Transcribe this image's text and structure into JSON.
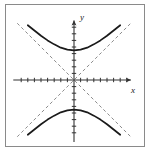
{
  "figure": {
    "background_color": "#ffffff",
    "frame_color": "#8a8a8a",
    "curve_color": "#1a1a1a",
    "axis_color": "#333333",
    "asymptote_color": "#8c8c8c"
  },
  "axes": {
    "x_label": "x",
    "y_label": "y",
    "x_ticks_left": 8,
    "x_ticks_right": 8,
    "y_ticks_up": 8,
    "y_ticks_down": 8,
    "tick_spacing_px": 6.6,
    "origin_x_px": 74,
    "origin_y_px": 80,
    "x_arrow": "arrow-right",
    "y_arrow": "arrow-up"
  },
  "chart_data": {
    "type": "line",
    "xlabel": "x",
    "ylabel": "y",
    "xlim": [
      -9,
      9
    ],
    "ylim": [
      -9,
      9
    ],
    "grid": false,
    "legend": "none",
    "equation": "y^2/9 - x^2/9 = 1",
    "vertices": [
      [
        0,
        4.5
      ],
      [
        0,
        -4.5
      ]
    ],
    "asymptote_slopes": [
      1,
      -1
    ],
    "series": [
      {
        "name": "upper-branch",
        "style": "solid",
        "points": [
          [
            -7.0,
            8.3
          ],
          [
            -6.0,
            7.5
          ],
          [
            -5.0,
            6.7
          ],
          [
            -4.0,
            6.0
          ],
          [
            -3.0,
            5.4
          ],
          [
            -2.0,
            4.9
          ],
          [
            -1.0,
            4.6
          ],
          [
            0.0,
            4.5
          ],
          [
            1.0,
            4.6
          ],
          [
            2.0,
            4.9
          ],
          [
            3.0,
            5.4
          ],
          [
            4.0,
            6.0
          ],
          [
            5.0,
            6.7
          ],
          [
            6.0,
            7.5
          ],
          [
            7.0,
            8.3
          ]
        ]
      },
      {
        "name": "lower-branch",
        "style": "solid",
        "points": [
          [
            -7.0,
            -8.3
          ],
          [
            -6.0,
            -7.5
          ],
          [
            -5.0,
            -6.7
          ],
          [
            -4.0,
            -6.0
          ],
          [
            -3.0,
            -5.4
          ],
          [
            -2.0,
            -4.9
          ],
          [
            -1.0,
            -4.6
          ],
          [
            0.0,
            -4.5
          ],
          [
            1.0,
            -4.6
          ],
          [
            2.0,
            -4.9
          ],
          [
            3.0,
            -5.4
          ],
          [
            4.0,
            -6.0
          ],
          [
            5.0,
            -6.7
          ],
          [
            6.0,
            -7.5
          ],
          [
            7.0,
            -8.3
          ]
        ]
      },
      {
        "name": "asymptote-positive",
        "style": "dashed",
        "points": [
          [
            -8.6,
            -8.6
          ],
          [
            8.6,
            8.6
          ]
        ]
      },
      {
        "name": "asymptote-negative",
        "style": "dashed",
        "points": [
          [
            -8.6,
            8.6
          ],
          [
            8.6,
            -8.6
          ]
        ]
      }
    ]
  }
}
